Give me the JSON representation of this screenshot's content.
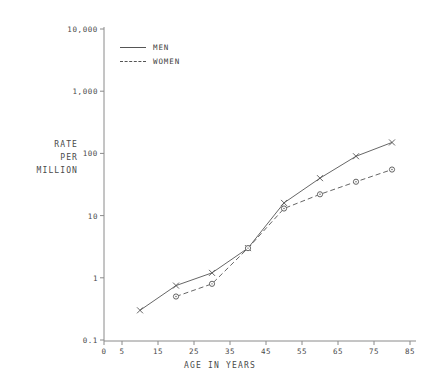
{
  "chart_data": {
    "type": "line",
    "title": "",
    "xlabel": "AGE IN YEARS",
    "ylabel": "RATE PER MILLION",
    "ylabel_lines": [
      "RATE",
      "PER",
      "MILLION"
    ],
    "yscale": "log",
    "ylim": [
      0.1,
      10000
    ],
    "xlim": [
      0,
      85
    ],
    "grid": false,
    "legend_position": "top-left-inside",
    "ytick_labels": [
      "10,000",
      "1,000",
      "100",
      "10",
      "1",
      "0.1"
    ],
    "ytick_values": [
      10000,
      1000,
      100,
      10,
      1,
      0.1
    ],
    "xtick_labels": [
      "0",
      "5",
      "15",
      "25",
      "35",
      "45",
      "55",
      "65",
      "75",
      "85"
    ],
    "xtick_values": [
      0,
      5,
      15,
      25,
      35,
      45,
      55,
      65,
      75,
      85
    ],
    "series": [
      {
        "name": "MEN",
        "style": "solid",
        "marker": "x",
        "x": [
          10,
          20,
          30,
          40,
          50,
          60,
          70,
          80
        ],
        "values": [
          0.3,
          0.75,
          1.2,
          3.0,
          16,
          40,
          90,
          150
        ]
      },
      {
        "name": "WOMEN",
        "style": "dashed",
        "marker": "circle",
        "x": [
          20,
          30,
          40,
          50,
          60,
          70,
          80
        ],
        "values": [
          0.5,
          0.8,
          3.0,
          13,
          22,
          35,
          55
        ]
      }
    ],
    "colors": {
      "men": "#555555",
      "women": "#555555",
      "axis": "#7a7a7a",
      "text": "#3f3f3f"
    }
  }
}
